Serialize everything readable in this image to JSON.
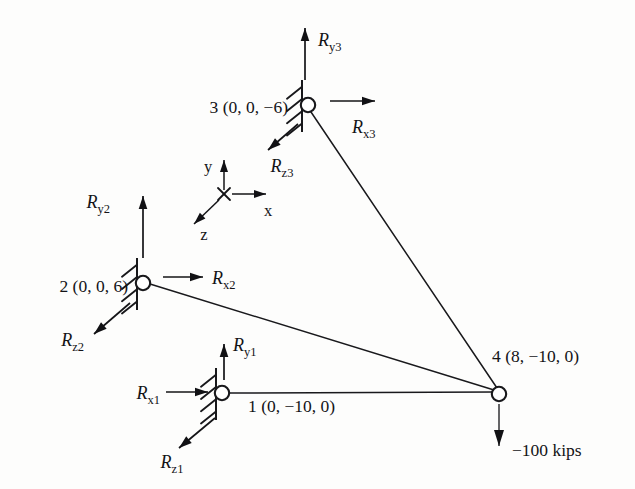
{
  "figure": {
    "kind": "space-truss-free-body-diagram",
    "background_color": "#fdfdfc",
    "line_color": "#18181b",
    "joint_fill": "#ffffff",
    "width": 635,
    "height": 489
  },
  "nodes": [
    {
      "id": "node-1",
      "number": "1",
      "label": "1 (0, −10, 0)",
      "coordinates": "(0, −10, 0)",
      "x": 222,
      "y": 393,
      "label_x": 248,
      "label_y": 412,
      "label_anchor": "start",
      "supported": true
    },
    {
      "id": "node-2",
      "number": "2",
      "label": "2 (0, 0, 6)",
      "coordinates": "(0, 0, 6)",
      "x": 143,
      "y": 283,
      "label_x": 128,
      "label_y": 292,
      "label_anchor": "end",
      "supported": true
    },
    {
      "id": "node-3",
      "number": "3",
      "label": "3 (0, 0, −6)",
      "coordinates": "(0, 0, −6)",
      "x": 308,
      "y": 105,
      "label_x": 288,
      "label_y": 113,
      "label_anchor": "end",
      "supported": true
    },
    {
      "id": "node-4",
      "number": "4",
      "label": "4 (8, −10, 0)",
      "coordinates": "(8, −10, 0)",
      "x": 499,
      "y": 394,
      "label_x": 492,
      "label_y": 362,
      "label_anchor": "start",
      "supported": false
    }
  ],
  "members": [
    {
      "id": "member-1-4",
      "from": "node-1",
      "to": "node-4",
      "x1": 228,
      "y1": 393,
      "x2": 494,
      "y2": 392
    },
    {
      "id": "member-2-4",
      "from": "node-2",
      "to": "node-4",
      "x1": 150,
      "y1": 284,
      "x2": 494,
      "y2": 390
    },
    {
      "id": "member-3-4",
      "from": "node-3",
      "to": "node-4",
      "x1": 311,
      "y1": 112,
      "x2": 497,
      "y2": 388
    }
  ],
  "supports": [
    {
      "id": "support-1",
      "node": "node-1",
      "spine_x": 216,
      "spine_y1": 368,
      "spine_y2": 420,
      "ticks": 4
    },
    {
      "id": "support-2",
      "node": "node-2",
      "spine_x": 137,
      "spine_y1": 258,
      "spine_y2": 310,
      "ticks": 4
    },
    {
      "id": "support-3",
      "node": "node-3",
      "spine_x": 302,
      "spine_y1": 80,
      "spine_y2": 132,
      "ticks": 4
    }
  ],
  "reactions": [
    {
      "id": "reaction-Ry1",
      "node": "node-1",
      "symbol": "R",
      "subscript": "y1",
      "direction": "up",
      "shaft": {
        "x1": 224,
        "y1": 380,
        "x2": 224,
        "y2": 344
      },
      "label_x": 233,
      "label_y": 351,
      "label_anchor": "start"
    },
    {
      "id": "reaction-Rx1",
      "node": "node-1",
      "symbol": "R",
      "subscript": "x1",
      "direction": "right",
      "shaft": {
        "x1": 166,
        "y1": 392,
        "x2": 208,
        "y2": 392
      },
      "label_x": 160,
      "label_y": 399,
      "label_anchor": "end"
    },
    {
      "id": "reaction-Rz1",
      "node": "node-1",
      "symbol": "R",
      "subscript": "z1",
      "direction": "down-left",
      "shaft": {
        "x1": 215,
        "y1": 418,
        "x2": 179,
        "y2": 448
      },
      "label_x": 172,
      "label_y": 468,
      "label_anchor": "middle"
    },
    {
      "id": "reaction-Ry2",
      "node": "node-2",
      "symbol": "R",
      "subscript": "y2",
      "direction": "up",
      "shaft": {
        "x1": 143,
        "y1": 258,
        "x2": 143,
        "y2": 196
      },
      "label_x": 110,
      "label_y": 208,
      "label_anchor": "end"
    },
    {
      "id": "reaction-Rx2",
      "node": "node-2",
      "symbol": "R",
      "subscript": "x2",
      "direction": "right",
      "shaft": {
        "x1": 163,
        "y1": 277,
        "x2": 203,
        "y2": 277
      },
      "label_x": 212,
      "label_y": 284,
      "label_anchor": "start"
    },
    {
      "id": "reaction-Rz2",
      "node": "node-2",
      "symbol": "R",
      "subscript": "z2",
      "direction": "down-left",
      "shaft": {
        "x1": 130,
        "y1": 303,
        "x2": 94,
        "y2": 334
      },
      "label_x": 84,
      "label_y": 346,
      "label_anchor": "end"
    },
    {
      "id": "reaction-Ry3",
      "node": "node-3",
      "symbol": "R",
      "subscript": "y3",
      "direction": "up",
      "shaft": {
        "x1": 305,
        "y1": 80,
        "x2": 305,
        "y2": 28
      },
      "label_x": 318,
      "label_y": 46,
      "label_anchor": "start"
    },
    {
      "id": "reaction-Rx3",
      "node": "node-3",
      "symbol": "R",
      "subscript": "x3",
      "direction": "right",
      "shaft": {
        "x1": 330,
        "y1": 101,
        "x2": 375,
        "y2": 101
      },
      "label_x": 352,
      "label_y": 133,
      "label_anchor": "start"
    },
    {
      "id": "reaction-Rz3",
      "node": "node-3",
      "symbol": "R",
      "subscript": "z3",
      "direction": "down-left",
      "shaft": {
        "x1": 298,
        "y1": 124,
        "x2": 268,
        "y2": 150
      },
      "label_x": 282,
      "label_y": 172,
      "label_anchor": "middle"
    }
  ],
  "load": {
    "id": "load-node-4",
    "node": "node-4",
    "label": "−100 kips",
    "direction": "down",
    "shaft": {
      "x1": 499,
      "y1": 404,
      "x2": 499,
      "y2": 446
    },
    "label_x": 512,
    "label_y": 456,
    "label_anchor": "start"
  },
  "axis_triad": {
    "id": "coordinate-axes",
    "origin_x": 224,
    "origin_y": 194,
    "cross_size": 6,
    "axes": [
      {
        "id": "axis-y",
        "label": "y",
        "direction": "up",
        "shaft": {
          "x1": 224,
          "y1": 190,
          "x2": 224,
          "y2": 160
        },
        "label_x": 208,
        "label_y": 172,
        "label_anchor": "middle"
      },
      {
        "id": "axis-x",
        "label": "x",
        "direction": "right",
        "shaft": {
          "x1": 232,
          "y1": 194,
          "x2": 266,
          "y2": 194
        },
        "label_x": 268,
        "label_y": 216,
        "label_anchor": "middle"
      },
      {
        "id": "axis-z",
        "label": "z",
        "direction": "down-left",
        "shaft": {
          "x1": 219,
          "y1": 200,
          "x2": 194,
          "y2": 224
        },
        "label_x": 204,
        "label_y": 240,
        "label_anchor": "middle"
      }
    ]
  }
}
